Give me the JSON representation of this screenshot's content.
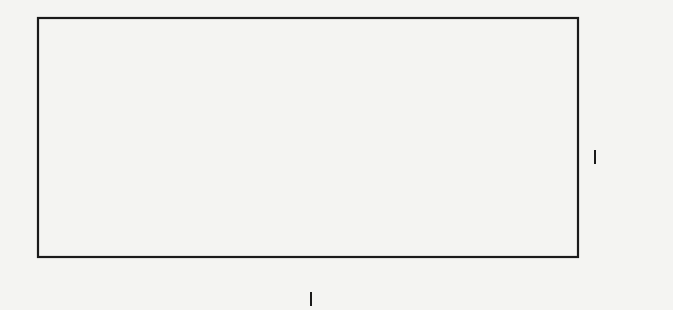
{
  "figure": {
    "kind": "line-drawing",
    "background_color": "#f4f4f2",
    "ink_color": "#1a1a1a",
    "canvas": {
      "width": 673,
      "height": 310
    },
    "frame": {
      "name": "outer-rectangle",
      "x": 38,
      "y": 18,
      "width": 540,
      "height": 239,
      "stroke_width": 2.2
    },
    "fibers": {
      "description": "vertical lines subdividing the rectangle",
      "stroke_width": 1.8,
      "x_positions": [
        102,
        190,
        266,
        341,
        428,
        515
      ]
    },
    "points": {
      "description": "marked points (dots) in the total space",
      "radius": 4.2,
      "coords": [
        {
          "x": 102,
          "y": 255
        },
        {
          "x": 113,
          "y": 238
        },
        {
          "x": 190,
          "y": 18
        },
        {
          "x": 199,
          "y": 34
        },
        {
          "x": 265,
          "y": 243
        },
        {
          "x": 279,
          "y": 229
        },
        {
          "x": 341,
          "y": 30
        },
        {
          "x": 350,
          "y": 43
        },
        {
          "x": 427,
          "y": 233
        },
        {
          "x": 435,
          "y": 221
        },
        {
          "x": 443,
          "y": 208
        },
        {
          "x": 516,
          "y": 41
        },
        {
          "x": 525,
          "y": 58
        }
      ]
    },
    "labels": {
      "right": {
        "name": "vertical-axis-label",
        "c": "C",
        "p": "P",
        "sub": "1",
        "plain_text": "CP_1"
      },
      "bottom": {
        "name": "horizontal-axis-label",
        "c": "C",
        "p": "P",
        "sub": "1",
        "plain_text": "CP_1"
      }
    }
  }
}
